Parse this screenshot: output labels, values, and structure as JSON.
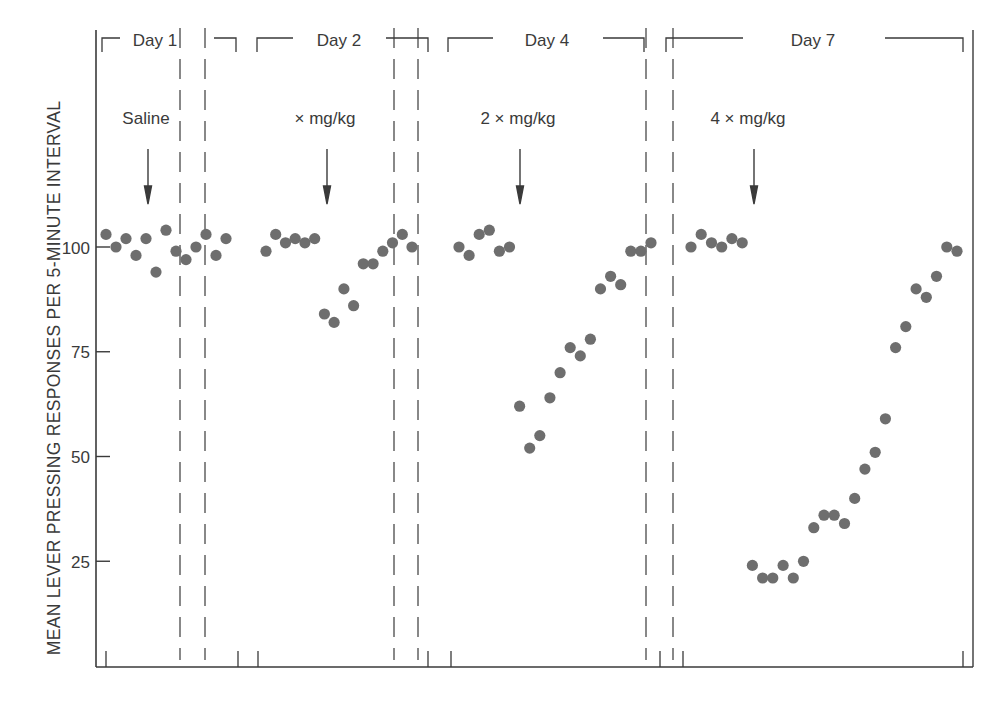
{
  "chart_data": {
    "type": "scatter",
    "title": "",
    "xlabel": "",
    "ylabel": "MEAN LEVER PRESSING RESPONSES PER 5-MINUTE INTERVAL",
    "ylim": [
      0,
      110
    ],
    "yticks": [
      25,
      50,
      75,
      100
    ],
    "grid": false,
    "legend": null,
    "panels": [
      {
        "label": "Day 1",
        "annotation": "Saline",
        "arrow_index": 5,
        "values": [
          103,
          100,
          102,
          98,
          102,
          94,
          104,
          99,
          97,
          100,
          103,
          98,
          102
        ]
      },
      {
        "label": "Day 2",
        "annotation": "× mg/kg",
        "arrow_index": 6,
        "values": [
          99,
          103,
          101,
          102,
          101,
          102,
          84,
          82,
          90,
          86,
          96,
          96,
          99,
          101,
          103,
          100
        ]
      },
      {
        "label": "Day 4",
        "annotation": "2 × mg/kg",
        "arrow_index": 6,
        "values": [
          100,
          98,
          103,
          104,
          99,
          100,
          62,
          52,
          55,
          64,
          70,
          76,
          74,
          78,
          90,
          93,
          91,
          99,
          99,
          101
        ]
      },
      {
        "label": "Day 7",
        "annotation": "4 × mg/kg",
        "arrow_index": 6,
        "values": [
          100,
          103,
          101,
          100,
          102,
          101,
          24,
          21,
          21,
          24,
          21,
          25,
          33,
          36,
          36,
          34,
          40,
          47,
          51,
          59,
          76,
          81,
          90,
          88,
          93,
          100,
          99
        ]
      }
    ]
  },
  "axis": {
    "tick_labels": [
      "100",
      "75",
      "50",
      "25"
    ]
  },
  "colors": {
    "ink": "#3a3a3a",
    "dot": "#6e6e6e",
    "background": "#ffffff"
  }
}
